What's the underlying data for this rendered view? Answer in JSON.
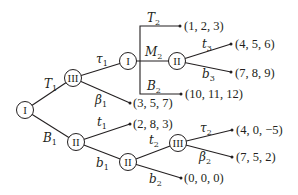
{
  "nodes": {
    "root": "I",
    "n_T1": "III",
    "n_tau1": "I",
    "n_M2": "II",
    "n_B1": "II",
    "n_b1": "II",
    "n_t2": "III"
  },
  "edges": {
    "T1": {
      "base": "T",
      "sub": "1"
    },
    "B1": {
      "base": "B",
      "sub": "1"
    },
    "tau1": {
      "base": "τ",
      "sub": "1"
    },
    "beta1": {
      "base": "β",
      "sub": "1"
    },
    "T2": {
      "base": "T",
      "sub": "2"
    },
    "M2": {
      "base": "M",
      "sub": "2"
    },
    "B2": {
      "base": "B",
      "sub": "2"
    },
    "t3": {
      "base": "t",
      "sub": "3"
    },
    "b3": {
      "base": "b",
      "sub": "3"
    },
    "t1": {
      "base": "t",
      "sub": "1"
    },
    "b1": {
      "base": "b",
      "sub": "1"
    },
    "t2": {
      "base": "t",
      "sub": "2"
    },
    "b2": {
      "base": "b",
      "sub": "2"
    },
    "tau2": {
      "base": "τ",
      "sub": "2"
    },
    "beta2": {
      "base": "β",
      "sub": "2"
    }
  },
  "payoffs": {
    "T2": "(1, 2, 3)",
    "t3": "(4, 5, 6)",
    "b3": "(7, 8, 9)",
    "B2": "(10, 11, 12)",
    "beta1": "(3, 5, 7)",
    "t1": "(2, 8, 3)",
    "tau2": "(4, 0, −5)",
    "beta2": "(7, 5, 2)",
    "b2": "(0, 0, 0)"
  },
  "colors": {
    "ink": "#231f20",
    "background": "#ffffff"
  }
}
